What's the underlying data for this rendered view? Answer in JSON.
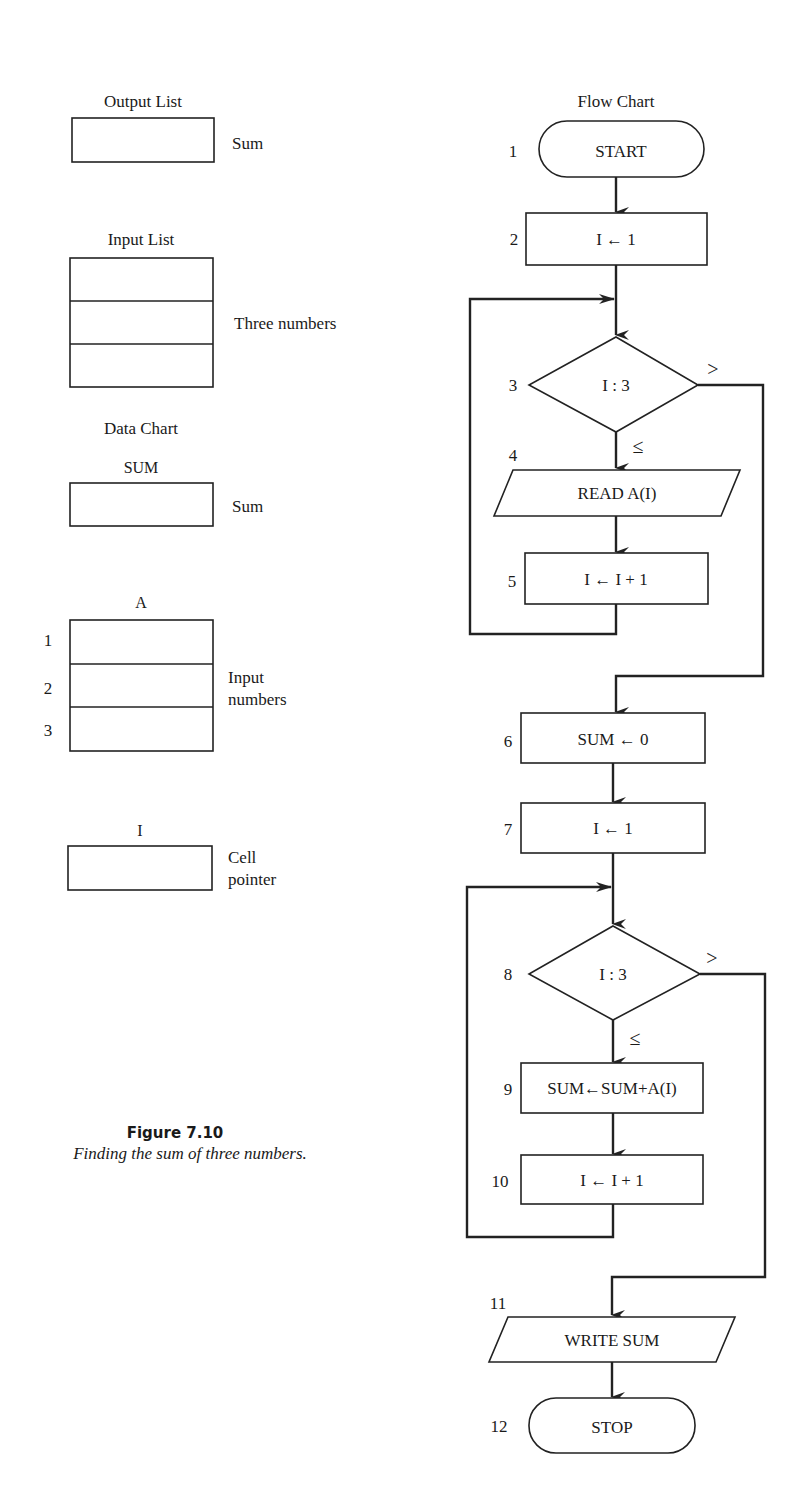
{
  "left_panel": {
    "output_list": {
      "title": "Output List",
      "cells": 1,
      "description": "Sum"
    },
    "input_list": {
      "title": "Input List",
      "cells": 3,
      "description": "Three numbers"
    },
    "data_chart": {
      "title": "Data Chart",
      "sum": {
        "label": "SUM",
        "description": "Sum"
      },
      "array_a": {
        "label": "A",
        "indices": [
          "1",
          "2",
          "3"
        ],
        "description_line1": "Input",
        "description_line2": "numbers"
      },
      "pointer_i": {
        "label": "I",
        "description_line1": "Cell",
        "description_line2": "pointer"
      }
    }
  },
  "figure": {
    "number": "Figure 7.10",
    "caption": "Finding the sum of three numbers."
  },
  "flow_chart": {
    "title": "Flow Chart",
    "steps": [
      {
        "n": "1",
        "type": "terminal",
        "text": "START"
      },
      {
        "n": "2",
        "type": "process",
        "text": "I ← 1"
      },
      {
        "n": "3",
        "type": "decision",
        "text": "I : 3",
        "yes_label": "≤",
        "no_label": ">"
      },
      {
        "n": "4",
        "type": "io",
        "text": "READ A(I)"
      },
      {
        "n": "5",
        "type": "process",
        "text": "I ← I + 1"
      },
      {
        "n": "6",
        "type": "process",
        "text": "SUM ← 0"
      },
      {
        "n": "7",
        "type": "process",
        "text": "I ← 1"
      },
      {
        "n": "8",
        "type": "decision",
        "text": "I : 3",
        "yes_label": "≤",
        "no_label": ">"
      },
      {
        "n": "9",
        "type": "process",
        "text": "SUM←SUM+A(I)"
      },
      {
        "n": "10",
        "type": "process",
        "text": "I ← I + 1"
      },
      {
        "n": "11",
        "type": "io",
        "text": "WRITE SUM"
      },
      {
        "n": "12",
        "type": "terminal",
        "text": "STOP"
      }
    ]
  }
}
